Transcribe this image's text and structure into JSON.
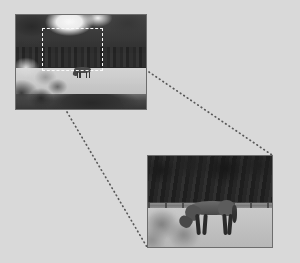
{
  "figure": {
    "background_color": "#d9d9d9",
    "panels": [
      {
        "id": "overview",
        "name": "wide-shot-of-field-with-horse",
        "alt": "Wide grayscale photograph: dark treeline with a bright sky gap, a pale grass field with a small distant horse, blurred dark foliage and shadow across the lower-left foreground.",
        "x": 15,
        "y": 14,
        "width": 132,
        "height": 96,
        "border_color": "#6e6e6e",
        "selection": {
          "name": "region-of-interest",
          "style": "dashed",
          "color": "#f4f4f4",
          "x": 41,
          "y": 27,
          "width": 61,
          "height": 43
        },
        "content": {
          "sky_label": "bright sky gap",
          "treeline_label": "dark treeline",
          "field_label": "pale grass field",
          "foreground_label": "blurred foliage and shadow",
          "subject_label": "distant horse"
        }
      },
      {
        "id": "detail",
        "name": "close-up-of-grazing-horse",
        "alt": "Enlarged grayscale photograph: a horse grazing head-down on pale ground in front of a post-and-rail fence with a dense dark treeline behind; a soft shadow falls across the lower-left.",
        "x": 147,
        "y": 155,
        "width": 126,
        "height": 93,
        "border_color": "#6e6e6e",
        "content": {
          "treeline_label": "dense dark treeline",
          "fence_label": "post-and-rail fence",
          "field_label": "pale ground",
          "shadow_label": "soft cast shadow",
          "subject_label": "grazing horse"
        }
      }
    ],
    "connectors": [
      {
        "name": "connector-top",
        "style": "dotted",
        "color": "#585858",
        "from": {
          "x": 149,
          "y": 72
        },
        "to": {
          "x": 272,
          "y": 155
        }
      },
      {
        "name": "connector-bottom",
        "style": "dotted",
        "color": "#585858",
        "from": {
          "x": 67,
          "y": 112
        },
        "to": {
          "x": 147,
          "y": 247
        }
      }
    ]
  }
}
